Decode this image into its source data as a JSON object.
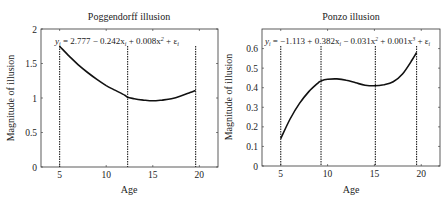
{
  "chart_data": [
    {
      "type": "line",
      "title": "Poggendorff illusion",
      "xlabel": "Age",
      "ylabel": "Magnitude of illusion",
      "xlim": [
        3,
        22
      ],
      "ylim": [
        0,
        2
      ],
      "xticks": [
        5,
        10,
        15,
        20
      ],
      "yticks": [
        0,
        0.5,
        1,
        1.5,
        2
      ],
      "ytick_labels": [
        "0",
        "0.5",
        "1",
        "1.5",
        "2"
      ],
      "equation": "y_i = 2.777 − 0.242x_i + 0.008x_i² + ε_i",
      "equation_parts": {
        "lhs": "y",
        "sub": "i",
        "body": " = 2.777 − 0.242x",
        "t2": " + 0.008x",
        "sq": "2",
        "t3": " + ε"
      },
      "grid": false,
      "series": [
        {
          "name": "fit",
          "x": [
            5,
            6,
            7,
            8,
            9,
            10,
            11,
            12,
            12.3,
            13,
            14,
            15,
            16,
            17,
            18,
            19,
            19.6
          ],
          "values": [
            1.75,
            1.61,
            1.48,
            1.37,
            1.27,
            1.18,
            1.11,
            1.04,
            1.01,
            0.99,
            0.97,
            0.96,
            0.97,
            0.99,
            1.03,
            1.08,
            1.11
          ]
        }
      ],
      "vertical_dashed_lines_x": [
        5,
        12.3,
        19.6
      ]
    },
    {
      "type": "line",
      "title": "Ponzo illusion",
      "xlabel": "Age",
      "ylabel": "Magnitude of illusion",
      "xlim": [
        3,
        22
      ],
      "ylim": [
        0,
        0.7
      ],
      "xticks": [
        5,
        10,
        15,
        20
      ],
      "yticks": [
        0,
        0.1,
        0.2,
        0.3,
        0.4,
        0.5,
        0.6
      ],
      "ytick_labels": [
        "0",
        "0.1",
        "0.2",
        "0.3",
        "0.4",
        "0.5",
        "0.6"
      ],
      "equation": "y_i = −1.113 + 0.382x_i − 0.031x_i² + 0.001x_i³ + ε_i",
      "equation_parts": {
        "lhs": "y",
        "sub": "i",
        "body": " = −1.113 + 0.382x",
        "t2": " − 0.031x",
        "sq": "2",
        "t3": " + 0.001x",
        "cube": "3",
        "t4": " + ε"
      },
      "grid": false,
      "series": [
        {
          "name": "fit",
          "x": [
            5,
            6,
            7,
            8,
            9,
            9.3,
            10,
            11,
            12,
            13,
            14,
            15,
            16,
            17,
            18,
            19,
            19.5
          ],
          "values": [
            0.14,
            0.24,
            0.32,
            0.38,
            0.425,
            0.435,
            0.443,
            0.445,
            0.438,
            0.425,
            0.413,
            0.41,
            0.415,
            0.43,
            0.47,
            0.54,
            0.58
          ]
        }
      ],
      "vertical_dashed_lines_x": [
        5,
        9.3,
        15.1,
        19.5
      ]
    }
  ]
}
